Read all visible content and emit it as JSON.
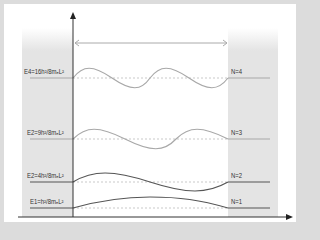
{
  "diagram": {
    "colors": {
      "frame": "#dcdcdc",
      "panel": "#ffffff",
      "well": "#e6e6e6",
      "axis": "#333333",
      "width_arrow": "#aaaaaa",
      "level_high": "#a8a8a8",
      "level_low": "#555555",
      "baseline_dashed": "#bbbbbb"
    },
    "width_marker": {
      "label": "L",
      "visible_label": ""
    },
    "levels": [
      {
        "n": 4,
        "energy_label": "E4=16h²/8mₑL²",
        "state_label": "N=4",
        "half_waves": 4,
        "color": "#a8a8a8"
      },
      {
        "n": 3,
        "energy_label": "E2=9h²/8mₑL²",
        "state_label": "N=3",
        "half_waves": 3,
        "color": "#a8a8a8"
      },
      {
        "n": 2,
        "energy_label": "E2=4h²/8mₑL²",
        "state_label": "N=2",
        "half_waves": 2,
        "color": "#555555"
      },
      {
        "n": 1,
        "energy_label": "E1=h²/8mₑL²",
        "state_label": "N=1",
        "half_waves": 1,
        "color": "#555555"
      }
    ]
  }
}
